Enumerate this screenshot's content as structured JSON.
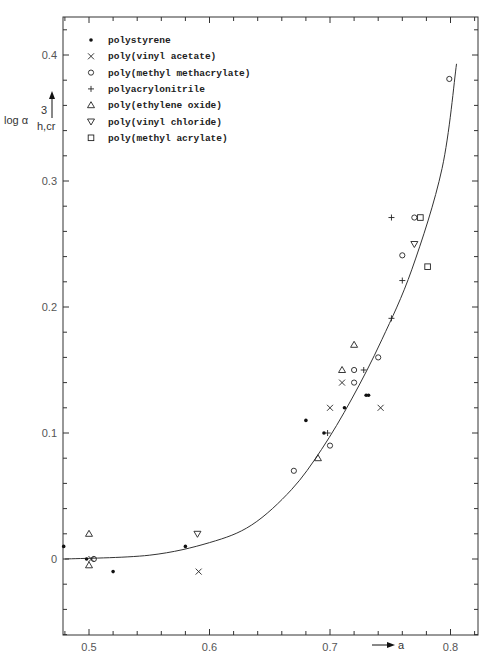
{
  "chart_data": {
    "type": "scatter",
    "title": "",
    "xlabel": "a",
    "ylabel": "log α³_h,cr",
    "xlim": [
      0.48,
      0.82
    ],
    "ylim": [
      -0.06,
      0.43
    ],
    "grid": false,
    "legend_position": "upper-left",
    "x_ticks": [
      0.5,
      0.6,
      0.7,
      0.8
    ],
    "x_tick_labels": [
      "0.5",
      "0.6",
      "0.7",
      "0.8"
    ],
    "y_ticks": [
      0,
      0.1,
      0.2,
      0.3,
      0.4
    ],
    "y_tick_labels": [
      "0",
      "0.1",
      "0.2",
      "0.3",
      "0.4"
    ],
    "series": [
      {
        "name": "polystyrene",
        "marker": "dot",
        "symbol": "•",
        "points": [
          [
            0.479,
            0.01
          ],
          [
            0.498,
            0.0
          ],
          [
            0.52,
            -0.01
          ],
          [
            0.58,
            0.01
          ],
          [
            0.68,
            0.11
          ],
          [
            0.695,
            0.1
          ],
          [
            0.712,
            0.12
          ],
          [
            0.73,
            0.13
          ],
          [
            0.732,
            0.13
          ]
        ]
      },
      {
        "name": "poly(vinyl acetate)",
        "marker": "x",
        "symbol": "×",
        "points": [
          [
            0.502,
            0.0
          ],
          [
            0.591,
            -0.01
          ],
          [
            0.7,
            0.12
          ],
          [
            0.71,
            0.14
          ],
          [
            0.742,
            0.12
          ]
        ]
      },
      {
        "name": "poly(methyl methacrylate)",
        "marker": "circle",
        "symbol": "o",
        "points": [
          [
            0.504,
            0.0
          ],
          [
            0.67,
            0.07
          ],
          [
            0.7,
            0.09
          ],
          [
            0.72,
            0.14
          ],
          [
            0.72,
            0.15
          ],
          [
            0.74,
            0.16
          ],
          [
            0.76,
            0.241
          ],
          [
            0.77,
            0.271
          ],
          [
            0.799,
            0.381
          ]
        ]
      },
      {
        "name": "polyacrylonitrile",
        "marker": "plus",
        "symbol": "+",
        "points": [
          [
            0.698,
            0.1
          ],
          [
            0.728,
            0.15
          ],
          [
            0.751,
            0.191
          ],
          [
            0.76,
            0.221
          ],
          [
            0.751,
            0.271
          ]
        ]
      },
      {
        "name": "poly(ethylene oxide)",
        "marker": "triangle-up",
        "symbol": "△",
        "points": [
          [
            0.5,
            0.02
          ],
          [
            0.5,
            -0.005
          ],
          [
            0.69,
            0.08
          ],
          [
            0.71,
            0.15
          ],
          [
            0.72,
            0.17
          ]
        ]
      },
      {
        "name": "poly(vinyl chloride)",
        "marker": "triangle-down",
        "symbol": "▽",
        "points": [
          [
            0.59,
            0.02
          ],
          [
            0.77,
            0.25
          ]
        ]
      },
      {
        "name": "poly(methyl acrylate)",
        "marker": "square",
        "symbol": "□",
        "points": [
          [
            0.775,
            0.271
          ],
          [
            0.781,
            0.232
          ]
        ]
      }
    ],
    "fit_curve": {
      "name": "fitted curve",
      "points": [
        [
          0.48,
          0.0
        ],
        [
          0.55,
          0.003
        ],
        [
          0.6,
          0.013
        ],
        [
          0.635,
          0.027
        ],
        [
          0.668,
          0.055
        ],
        [
          0.693,
          0.087
        ],
        [
          0.718,
          0.127
        ],
        [
          0.743,
          0.174
        ],
        [
          0.768,
          0.23
        ],
        [
          0.793,
          0.31
        ],
        [
          0.805,
          0.393
        ]
      ]
    }
  },
  "legend": {
    "items": [
      {
        "symbol": "•",
        "label": "polystyrene"
      },
      {
        "symbol": "×",
        "label": "poly(vinyl acetate)"
      },
      {
        "symbol": "o",
        "label": "poly(methyl methacrylate)"
      },
      {
        "symbol": "+",
        "label": "polyacrylonitrile"
      },
      {
        "symbol": "△",
        "label": "poly(ethylene oxide)"
      },
      {
        "symbol": "▽",
        "label": "poly(vinyl chloride)"
      },
      {
        "symbol": "□",
        "label": "poly(methyl acrylate)"
      }
    ]
  },
  "axes": {
    "ylabel_main": "log α",
    "ylabel_sup": "3",
    "ylabel_sub": "h,cr",
    "xlabel": "a"
  }
}
